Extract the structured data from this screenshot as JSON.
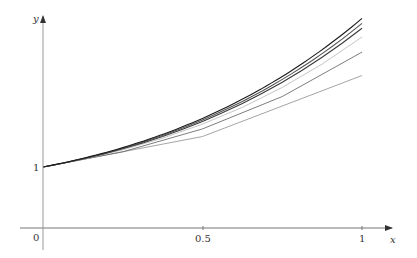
{
  "chart_data": {
    "type": "line",
    "title": "",
    "xlabel": "x",
    "ylabel": "y",
    "x_ticks": [
      {
        "value": 0,
        "label": "0"
      },
      {
        "value": 0.5,
        "label": "0.5"
      },
      {
        "value": 1,
        "label": "1"
      }
    ],
    "y_ticks": [
      {
        "value": 1,
        "label": "1"
      }
    ],
    "xlim": [
      -0.07,
      1.1
    ],
    "ylim": [
      -0.36,
      3.6
    ],
    "grid": false,
    "legend": null,
    "series": [
      {
        "name": "Euler h=0.5",
        "color": "#9a9a9a",
        "x": [
          0,
          0.5,
          1
        ],
        "y": [
          1,
          1.5,
          2.5
        ]
      },
      {
        "name": "Euler h=0.25",
        "color": "#6e6e6e",
        "x": [
          0,
          0.25,
          0.5,
          0.75,
          1
        ],
        "y": [
          1,
          1.25,
          1.625,
          2.1406,
          2.8633
        ]
      },
      {
        "name": "Euler h=0.125",
        "color": "#bdbdbd",
        "x": [
          0,
          0.125,
          0.25,
          0.375,
          0.5,
          0.625,
          0.75,
          0.875,
          1
        ],
        "y": [
          1,
          1.125,
          1.2813,
          1.4727,
          1.7036,
          1.979,
          2.3045,
          2.6863,
          3.1067
        ]
      },
      {
        "name": "Euler h=0.0625",
        "color": "#3a3a3a",
        "x": [
          0,
          0.25,
          0.5,
          0.75,
          1
        ],
        "y": [
          1,
          1.3052,
          1.7468,
          2.3724,
          3.2626
        ]
      },
      {
        "name": "Euler h=0.03125",
        "color": "#555555",
        "x": [
          0,
          0.25,
          0.5,
          0.75,
          1
        ],
        "y": [
          1,
          1.3278,
          1.7702,
          2.4129,
          3.3468
        ]
      },
      {
        "name": "Exact y=2e^x-x-1",
        "color": "#1a1a1a",
        "x": [
          0,
          0.25,
          0.5,
          0.75,
          1
        ],
        "y": [
          1,
          1.3181,
          1.7974,
          2.484,
          3.4366
        ]
      }
    ],
    "annotations": []
  },
  "axes": {
    "x_label": "x",
    "y_label": "y",
    "origin_label": "0",
    "y_tick_label": "1",
    "x_tick_mid": "0.5",
    "x_tick_end": "1"
  }
}
